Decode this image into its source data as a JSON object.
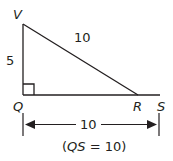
{
  "diagram": {
    "type": "right-triangle",
    "vertices": {
      "V": {
        "label": "V"
      },
      "Q": {
        "label": "Q"
      },
      "R": {
        "label": "R"
      },
      "S": {
        "label": "S"
      }
    },
    "sides": {
      "VQ": "5",
      "VR": "10"
    },
    "right_angle_at": "Q",
    "dimension": {
      "label": "10",
      "from": "Q",
      "to": "S"
    },
    "caption": "(QS = 10)",
    "caption_parts": {
      "open": "(",
      "var": "QS",
      "rest": " = 10)"
    },
    "colors": {
      "stroke": "#231f20",
      "background": "#ffffff"
    }
  }
}
